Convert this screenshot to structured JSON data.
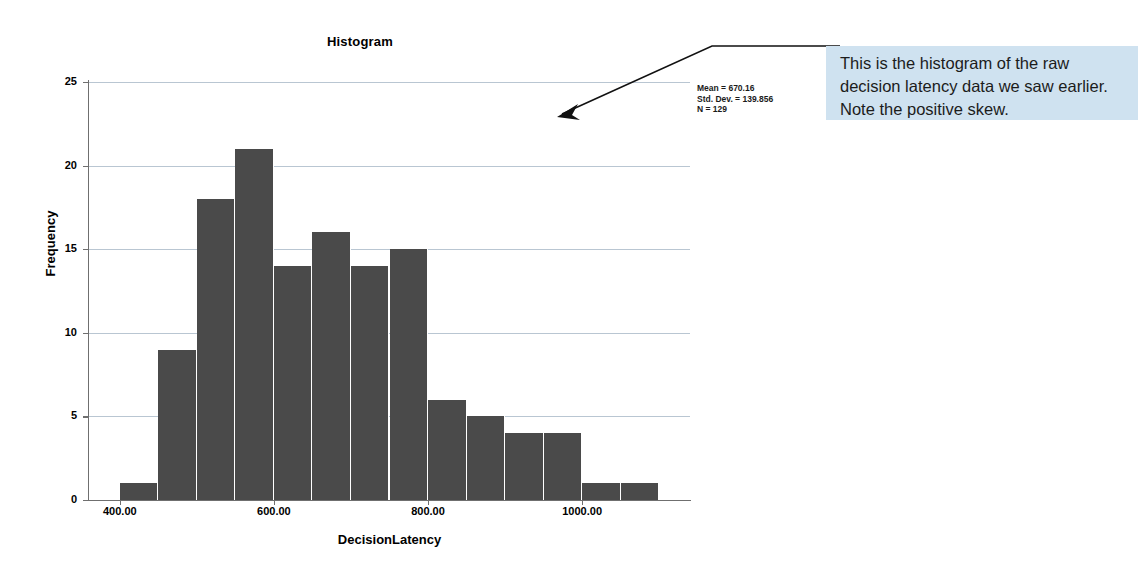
{
  "chart_data": {
    "type": "bar",
    "title": "Histogram",
    "xlabel": "DecisionLatency",
    "ylabel": "Frequency",
    "grid": true,
    "legend": null,
    "xlim": [
      360,
      1140
    ],
    "ylim": [
      0,
      25
    ],
    "x_tick_labels": [
      "400.00",
      "600.00",
      "800.00",
      "1000.00"
    ],
    "x_tick_values": [
      400,
      600,
      800,
      1000
    ],
    "y_tick_labels": [
      "0",
      "5",
      "10",
      "15",
      "20",
      "25"
    ],
    "y_tick_values": [
      0,
      5,
      10,
      15,
      20,
      25
    ],
    "bin_width": 50,
    "bin_starts": [
      400,
      450,
      500,
      550,
      600,
      650,
      700,
      750,
      800,
      850,
      900,
      950,
      1000,
      1050
    ],
    "categories": [
      "400-450",
      "450-500",
      "500-550",
      "550-600",
      "600-650",
      "650-700",
      "700-750",
      "750-800",
      "800-850",
      "850-900",
      "900-950",
      "950-1000",
      "1000-1050",
      "1050-1100"
    ],
    "values": [
      1,
      9,
      18,
      21,
      14,
      16,
      14,
      15,
      6,
      5,
      4,
      4,
      1,
      1
    ],
    "bar_color": "#4a4a4a",
    "gridline_color": "#b9c6d2",
    "annotations": [
      "Mean = 670.16",
      "Std. Dev. = 139.856",
      "N = 129"
    ]
  },
  "figure": {
    "title": "Histogram",
    "x_axis_title": "DecisionLatency",
    "y_axis_title": "Frequency",
    "stats": {
      "mean": "Mean = 670.16",
      "std_dev": "Std. Dev. = 139.856",
      "n": "N = 129"
    }
  },
  "callout": {
    "text": "This is the histogram of the raw decision latency data we saw earlier. Note the positive skew.",
    "background_color": "#cfe2f0"
  }
}
